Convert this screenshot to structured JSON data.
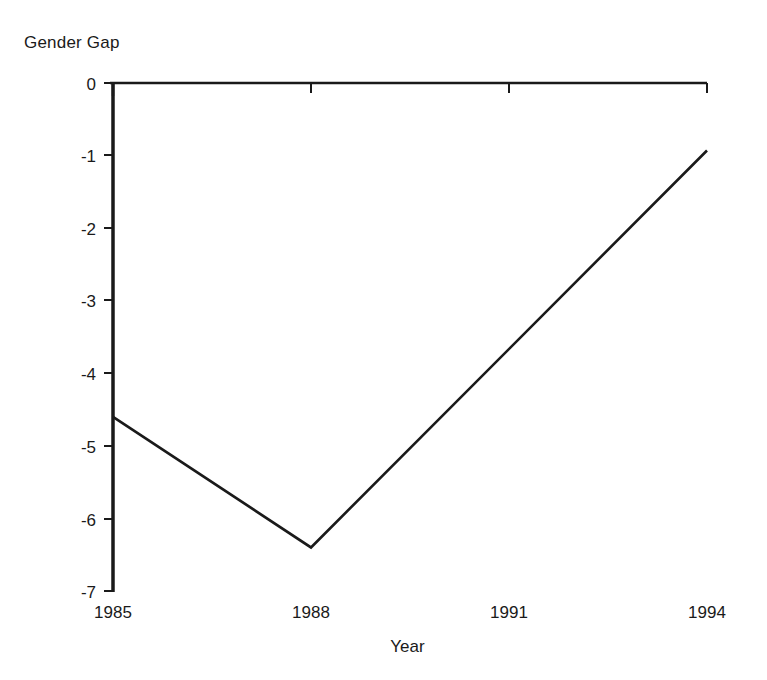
{
  "chart_data": {
    "type": "line",
    "title": "",
    "xlabel": "Year",
    "ylabel": "Gender Gap",
    "x": [
      1985,
      1988,
      1994
    ],
    "values": [
      -4.6,
      -6.4,
      -0.93
    ],
    "series": [
      {
        "name": "Gender Gap",
        "x": [
          1985,
          1988,
          1994
        ],
        "values": [
          -4.6,
          -6.4,
          -0.93
        ]
      }
    ],
    "reference_lines": [
      {
        "axis": "y",
        "value": 0,
        "label": "0"
      }
    ],
    "xlim": [
      1985,
      1994
    ],
    "ylim": [
      -7,
      0
    ],
    "xticks": [
      1985,
      1988,
      1991,
      1994
    ],
    "xtick_labels": [
      "1985",
      "1988",
      "1991",
      "1994"
    ],
    "yticks": [
      0,
      -1,
      -2,
      -3,
      -4,
      -5,
      -6,
      -7
    ],
    "ytick_labels": [
      "0",
      "-1",
      "-2",
      "-3",
      "-4",
      "-5",
      "-6",
      "-7"
    ],
    "grid": false,
    "legend": "none",
    "line_color": "#1a1a1a",
    "background_color": "#ffffff"
  },
  "axes": {
    "y_title": "Gender Gap",
    "x_title": "Year"
  },
  "ytick_labels": {
    "0": "0",
    "1": "-1",
    "2": "-2",
    "3": "-3",
    "4": "-4",
    "5": "-5",
    "6": "-6",
    "7": "-7"
  },
  "xtick_labels": {
    "0": "1985",
    "1": "1988",
    "2": "1991",
    "3": "1994"
  }
}
